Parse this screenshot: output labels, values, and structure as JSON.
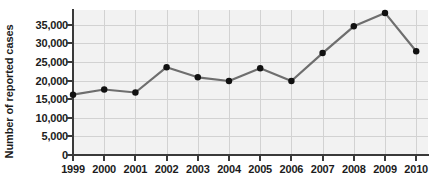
{
  "chart_data": {
    "type": "line",
    "title": "",
    "subtitle": "",
    "xlabel": "",
    "ylabel": "Number of reported cases",
    "categories": [
      "1999",
      "2000",
      "2001",
      "2002",
      "2003",
      "2004",
      "2005",
      "2006",
      "2007",
      "2008",
      "2009",
      "2010"
    ],
    "x": [
      1999,
      2000,
      2001,
      2002,
      2003,
      2004,
      2005,
      2006,
      2007,
      2008,
      2009,
      2010
    ],
    "values": [
      16200,
      17600,
      16800,
      23600,
      20900,
      19900,
      23300,
      19900,
      27400,
      34600,
      38200,
      27900
    ],
    "series": [
      {
        "name": "Number of reported cases",
        "values": [
          16200,
          17600,
          16800,
          23600,
          20900,
          19900,
          23300,
          19900,
          27400,
          34600,
          38200,
          27900
        ]
      }
    ],
    "ylim": [
      0,
      38500
    ],
    "xlim": [
      1998.6,
      2010.6
    ],
    "yticks": [
      0,
      5000,
      10000,
      15000,
      20000,
      25000,
      30000,
      35000
    ],
    "ytick_labels": [
      "0",
      "5,000",
      "10,000",
      "15,000",
      "20,000",
      "25,000",
      "30,000",
      "35,000"
    ],
    "xticks": [
      1999,
      2000,
      2001,
      2002,
      2003,
      2004,
      2005,
      2006,
      2007,
      2008,
      2009,
      2010
    ],
    "xtick_labels": [
      "1999",
      "2000",
      "2001",
      "2002",
      "2003",
      "2004",
      "2005",
      "2006",
      "2007",
      "2008",
      "2009",
      "2010"
    ],
    "grid": true,
    "grid_axis": "both",
    "legend": false,
    "legend_position": "none",
    "annotations": [],
    "colors": {
      "line": "#6e6e6e",
      "marker": "#111111",
      "plot_background": "#f2f2f2",
      "grid": "#d2d2d2",
      "axis": "#3a3a3a",
      "text": "#1c1c1c",
      "page_background": "#ffffff"
    },
    "marker": "circle",
    "marker_size": 5,
    "line_width": 2.2
  }
}
